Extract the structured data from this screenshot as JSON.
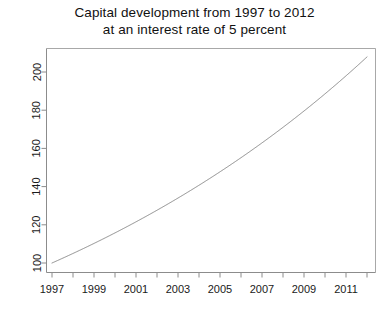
{
  "chart_data": {
    "type": "line",
    "title": "Capital development from 1997 to 2012 at an interest rate of 5 percent",
    "title_lines": [
      "Capital development from 1997 to 2012",
      "at an interest rate of 5 percent"
    ],
    "xlabel": "",
    "ylabel": "",
    "x": [
      1997,
      1998,
      1999,
      2000,
      2001,
      2002,
      2003,
      2004,
      2005,
      2006,
      2007,
      2008,
      2009,
      2010,
      2011,
      2012
    ],
    "values": [
      100.0,
      105.0,
      110.25,
      115.76,
      121.55,
      127.63,
      134.01,
      140.71,
      147.75,
      155.13,
      162.89,
      171.03,
      179.59,
      188.56,
      197.99,
      207.89
    ],
    "series": [
      {
        "name": "capital",
        "values": [
          100.0,
          105.0,
          110.25,
          115.76,
          121.55,
          127.63,
          134.01,
          140.71,
          147.75,
          155.13,
          162.89,
          171.03,
          179.59,
          188.56,
          197.99,
          207.89
        ]
      }
    ],
    "xlim": [
      1997,
      2012
    ],
    "ylim": [
      100,
      207.89
    ],
    "x_tick_values": [
      1997,
      1998,
      1999,
      2000,
      2001,
      2002,
      2003,
      2004,
      2005,
      2006,
      2007,
      2008,
      2009,
      2010,
      2011,
      2012
    ],
    "x_tick_labels_shown": [
      "1997",
      "1999",
      "2001",
      "2003",
      "2005",
      "2007",
      "2009",
      "2011"
    ],
    "x_tick_labels_shown_values": [
      1997,
      1999,
      2001,
      2003,
      2005,
      2007,
      2009,
      2011
    ],
    "y_tick_values": [
      100,
      120,
      140,
      160,
      180,
      200
    ],
    "y_tick_labels": [
      "100",
      "120",
      "140",
      "160",
      "180",
      "200"
    ],
    "y_tick_label_rotation_deg": -90,
    "grid": false,
    "legend": null,
    "legend_position": "none",
    "line_color": "#8c8c8c",
    "line_width": 1,
    "axis_color": "#8c8c8c",
    "background_color": "#ffffff",
    "text_color": "#1a1a1a",
    "box_style": "L-shaped-axes-plus-top-right-frame"
  },
  "axes": {
    "y_labels": [
      "100",
      "120",
      "140",
      "160",
      "180",
      "200"
    ],
    "x_labels": [
      "1997",
      "1999",
      "2001",
      "2003",
      "2005",
      "2007",
      "2009",
      "2011"
    ]
  }
}
